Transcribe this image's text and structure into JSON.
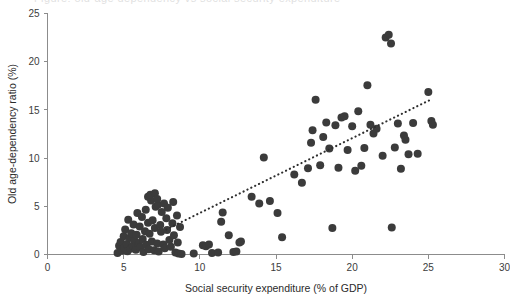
{
  "figure": {
    "background_color": "#ffffff",
    "truncated_top_text": "Figure: old-age dependency vs social security expenditure",
    "marker_color": "#3b3b3b",
    "axis_color": "#8c8c8c",
    "trendline_color": "#2e2e2e"
  },
  "chart_data": {
    "type": "scatter",
    "title": "",
    "xlabel": "Social security expenditure (% of GDP)",
    "ylabel": "Old age-dependency ratio (%)",
    "xlim": [
      0,
      30
    ],
    "ylim": [
      0,
      25
    ],
    "xticks": [
      0,
      5,
      10,
      15,
      20,
      25,
      30
    ],
    "yticks": [
      0,
      5,
      10,
      15,
      20,
      25
    ],
    "xtick_labels": [
      "0",
      "5",
      "10",
      "15",
      "20",
      "25",
      "30"
    ],
    "ytick_labels": [
      "0",
      "5",
      "10",
      "15",
      "20",
      "25"
    ],
    "grid": false,
    "legend": null,
    "marker_size_px": 8,
    "trendline": {
      "style": "dotted",
      "x_start": 7.8,
      "y_start": 2.6,
      "x_end": 25.2,
      "y_end": 16.1
    },
    "points": [
      [
        4.6,
        0.15
      ],
      [
        4.7,
        0.9
      ],
      [
        4.8,
        1.3
      ],
      [
        4.9,
        0.4
      ],
      [
        5.0,
        1.9
      ],
      [
        5.05,
        0.7
      ],
      [
        5.1,
        2.6
      ],
      [
        5.2,
        1.1
      ],
      [
        5.25,
        0.35
      ],
      [
        5.3,
        3.6
      ],
      [
        5.4,
        1.7
      ],
      [
        5.45,
        0.6
      ],
      [
        5.5,
        2.2
      ],
      [
        5.6,
        0.9
      ],
      [
        5.65,
        3.1
      ],
      [
        5.7,
        1.45
      ],
      [
        5.8,
        0.5
      ],
      [
        5.85,
        2.05
      ],
      [
        5.9,
        4.3
      ],
      [
        6.0,
        1.2
      ],
      [
        6.05,
        2.9
      ],
      [
        6.1,
        0.75
      ],
      [
        6.2,
        3.9
      ],
      [
        6.25,
        1.6
      ],
      [
        6.3,
        0.25
      ],
      [
        6.4,
        2.4
      ],
      [
        6.45,
        4.65
      ],
      [
        6.5,
        1.0
      ],
      [
        6.6,
        3.3
      ],
      [
        6.65,
        0.55
      ],
      [
        6.7,
        2.15
      ],
      [
        6.8,
        5.6
      ],
      [
        6.85,
        1.35
      ],
      [
        6.9,
        3.55
      ],
      [
        7.0,
        0.45
      ],
      [
        7.05,
        2.75
      ],
      [
        7.1,
        4.95
      ],
      [
        7.2,
        1.15
      ],
      [
        7.25,
        5.15
      ],
      [
        7.3,
        0.3
      ],
      [
        7.4,
        3.05
      ],
      [
        7.45,
        2.35
      ],
      [
        7.5,
        4.4
      ],
      [
        7.6,
        1.05
      ],
      [
        7.65,
        5.3
      ],
      [
        7.7,
        0.65
      ],
      [
        7.8,
        3.75
      ],
      [
        7.85,
        2.55
      ],
      [
        7.9,
        4.85
      ],
      [
        8.0,
        1.5
      ],
      [
        8.1,
        0.8
      ],
      [
        8.2,
        3.25
      ],
      [
        8.25,
        5.45
      ],
      [
        8.3,
        2.0
      ],
      [
        8.4,
        0.2
      ],
      [
        8.5,
        4.05
      ],
      [
        8.55,
        1.25
      ],
      [
        8.6,
        0.1
      ],
      [
        8.7,
        2.85
      ],
      [
        8.8,
        0.05
      ],
      [
        6.6,
        6.0
      ],
      [
        6.75,
        6.2
      ],
      [
        7.05,
        6.35
      ],
      [
        7.2,
        5.75
      ],
      [
        9.6,
        0.1
      ],
      [
        10.2,
        0.95
      ],
      [
        10.4,
        0.85
      ],
      [
        10.6,
        1.05
      ],
      [
        10.8,
        0.15
      ],
      [
        11.2,
        0.2
      ],
      [
        11.4,
        3.4
      ],
      [
        11.5,
        4.35
      ],
      [
        11.9,
        2.0
      ],
      [
        12.2,
        0.25
      ],
      [
        12.4,
        0.3
      ],
      [
        12.6,
        1.25
      ],
      [
        12.7,
        1.35
      ],
      [
        13.4,
        6.0
      ],
      [
        13.9,
        5.3
      ],
      [
        14.2,
        10.05
      ],
      [
        14.6,
        5.55
      ],
      [
        15.1,
        4.3
      ],
      [
        15.4,
        1.8
      ],
      [
        16.2,
        8.3
      ],
      [
        16.7,
        7.45
      ],
      [
        17.1,
        8.95
      ],
      [
        17.3,
        11.6
      ],
      [
        17.4,
        12.9
      ],
      [
        17.6,
        16.05
      ],
      [
        17.9,
        9.25
      ],
      [
        18.1,
        12.2
      ],
      [
        18.3,
        13.7
      ],
      [
        18.5,
        11.0
      ],
      [
        18.7,
        2.75
      ],
      [
        18.9,
        13.4
      ],
      [
        19.1,
        9.0
      ],
      [
        19.3,
        14.2
      ],
      [
        19.5,
        14.35
      ],
      [
        19.7,
        10.85
      ],
      [
        20.0,
        13.3
      ],
      [
        20.2,
        8.7
      ],
      [
        20.4,
        14.85
      ],
      [
        20.6,
        9.2
      ],
      [
        20.8,
        11.05
      ],
      [
        21.0,
        17.55
      ],
      [
        21.2,
        13.45
      ],
      [
        21.4,
        12.55
      ],
      [
        21.6,
        13.05
      ],
      [
        22.0,
        10.25
      ],
      [
        22.2,
        22.5
      ],
      [
        22.4,
        22.8
      ],
      [
        22.55,
        21.9
      ],
      [
        22.6,
        2.8
      ],
      [
        22.8,
        11.1
      ],
      [
        23.0,
        13.6
      ],
      [
        23.2,
        8.9
      ],
      [
        23.4,
        12.35
      ],
      [
        23.5,
        11.9
      ],
      [
        23.7,
        10.4
      ],
      [
        24.0,
        13.65
      ],
      [
        24.3,
        10.45
      ],
      [
        25.0,
        16.85
      ],
      [
        25.2,
        13.85
      ],
      [
        25.3,
        13.45
      ]
    ]
  }
}
